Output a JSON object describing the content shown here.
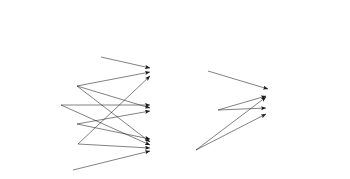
{
  "figure": {
    "background_color": "#ffffff",
    "line_color": "#1a1a1a",
    "text_color": "#1a1a1a"
  },
  "headers": [
    {
      "label": "Exposure pathways",
      "x": 15,
      "y": 14
    },
    {
      "label": "Exposure routes",
      "x": 158,
      "y": 14
    },
    {
      "label": "Biomarker",
      "x": 272,
      "y": 14
    }
  ],
  "columns": {
    "exposure_pathways": [
      {
        "label": "Drinking tap water/",
        "x": 15,
        "y": 57
      },
      {
        "label": "Tap water-based drinks",
        "x": 15,
        "y": 72
      },
      {
        "label": "Showering",
        "x": 15,
        "y": 90
      },
      {
        "label": "Bathing",
        "x": 15,
        "y": 109
      },
      {
        "label": "Swimming",
        "x": 15,
        "y": 128
      },
      {
        "label": "Dishwashing",
        "x": 15,
        "y": 147
      },
      {
        "label": "Toilet",
        "x": 15,
        "y": 167
      }
    ],
    "exposure_routes": [
      {
        "label": "Ingestion",
        "x": 158,
        "y": 73
      },
      {
        "label": "Skin absorption",
        "x": 158,
        "y": 111
      },
      {
        "label": "Inhalation",
        "x": 158,
        "y": 146
      }
    ],
    "biomarkers": [
      {
        "label": "Biomarker serum",
        "x": 274,
        "y": 92
      },
      {
        "label": "Exhaled breath",
        "x": 274,
        "y": 111
      }
    ]
  },
  "edges": [
    {
      "from": "Drinking tap water/ Tap water-based drinks",
      "to": "Ingestion",
      "x1": 101,
      "y1": 57,
      "x2": 150,
      "y2": 68
    },
    {
      "from": "Showering",
      "to": "Ingestion",
      "x1": 77,
      "y1": 86,
      "x2": 150,
      "y2": 72
    },
    {
      "from": "Dishwashing",
      "to": "Ingestion",
      "x1": 78,
      "y1": 144,
      "x2": 150,
      "y2": 76
    },
    {
      "from": "Bathing",
      "to": "Skin absorption",
      "x1": 61,
      "y1": 105,
      "x2": 150,
      "y2": 105
    },
    {
      "from": "Showering",
      "to": "Skin absorption",
      "x1": 77,
      "y1": 86,
      "x2": 150,
      "y2": 108
    },
    {
      "from": "Swimming",
      "to": "Skin absorption",
      "x1": 77,
      "y1": 124,
      "x2": 150,
      "y2": 111
    },
    {
      "from": "Swimming",
      "to": "Inhalation",
      "x1": 77,
      "y1": 124,
      "x2": 150,
      "y2": 139
    },
    {
      "from": "Showering",
      "to": "Inhalation",
      "x1": 77,
      "y1": 86,
      "x2": 150,
      "y2": 142
    },
    {
      "from": "Bathing",
      "to": "Inhalation",
      "x1": 61,
      "y1": 105,
      "x2": 150,
      "y2": 145
    },
    {
      "from": "Dishwashing",
      "to": "Inhalation",
      "x1": 78,
      "y1": 144,
      "x2": 150,
      "y2": 148
    },
    {
      "from": "Toilet",
      "to": "Inhalation",
      "x1": 73,
      "y1": 170,
      "x2": 150,
      "y2": 151
    },
    {
      "from": "Ingestion",
      "to": "Biomarker serum",
      "x1": 208,
      "y1": 71,
      "x2": 268,
      "y2": 89
    },
    {
      "from": "Skin absorption",
      "to": "Biomarker serum",
      "x1": 218,
      "y1": 110,
      "x2": 266,
      "y2": 96
    },
    {
      "from": "Skin absorption",
      "to": "Exhaled breath",
      "x1": 218,
      "y1": 110,
      "x2": 266,
      "y2": 108
    },
    {
      "from": "Inhalation",
      "to": "Biomarker serum",
      "x1": 196,
      "y1": 150,
      "x2": 266,
      "y2": 97
    },
    {
      "from": "Inhalation",
      "to": "Exhaled breath",
      "x1": 196,
      "y1": 150,
      "x2": 266,
      "y2": 114
    }
  ]
}
